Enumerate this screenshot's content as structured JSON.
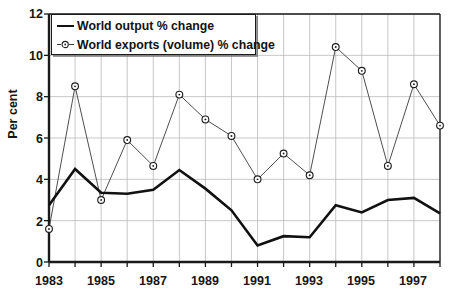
{
  "chart_data": {
    "type": "line",
    "title": "",
    "xlabel": "",
    "ylabel": "Per cent",
    "xlim": [
      1983,
      1998
    ],
    "ylim": [
      0,
      12
    ],
    "yticks": [
      0,
      2,
      4,
      6,
      8,
      10,
      12
    ],
    "xticks": [
      1983,
      1985,
      1987,
      1989,
      1991,
      1993,
      1995,
      1997
    ],
    "x": [
      1983,
      1984,
      1985,
      1986,
      1987,
      1988,
      1989,
      1990,
      1991,
      1992,
      1993,
      1994,
      1995,
      1996,
      1997,
      1998
    ],
    "grid": true,
    "legend_position": "top-left",
    "series": [
      {
        "name": "World output % change",
        "marker": "none",
        "color": "#111111",
        "linewidth": 2.6,
        "values": [
          2.75,
          4.5,
          3.35,
          3.3,
          3.5,
          4.45,
          3.55,
          2.5,
          0.8,
          1.25,
          1.2,
          2.75,
          2.4,
          3.0,
          3.1,
          2.35
        ]
      },
      {
        "name": "World exports (volume) % change",
        "marker": "circle-dot",
        "color": "#3a3a3a",
        "linewidth": 0.9,
        "values": [
          1.6,
          8.5,
          3.0,
          5.9,
          4.65,
          8.1,
          6.9,
          6.1,
          4.0,
          5.25,
          4.2,
          10.4,
          9.25,
          4.65,
          8.6,
          6.6
        ]
      }
    ]
  },
  "axes": {
    "ylabel": "Per cent",
    "ytick_labels": [
      "0",
      "2",
      "4",
      "6",
      "8",
      "10",
      "12"
    ],
    "xtick_labels": [
      "1983",
      "1985",
      "1987",
      "1989",
      "1991",
      "1993",
      "1995",
      "1997"
    ]
  },
  "legend": {
    "items": [
      {
        "label": "World output % change",
        "icon": "line-swatch-icon"
      },
      {
        "label": "World exports (volume) % change",
        "icon": "circle-marker-icon"
      }
    ]
  },
  "colors": {
    "axis": "#1a1a1a",
    "grid": "#b9b9b9",
    "output_line": "#111111",
    "exports_line": "#3a3a3a",
    "text": "#161616",
    "background": "#ffffff"
  }
}
